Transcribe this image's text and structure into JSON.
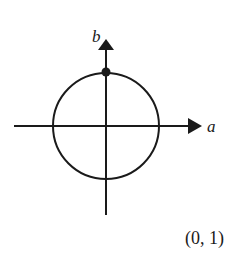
{
  "diagram": {
    "axes": {
      "horizontal_label": "a",
      "vertical_label": "b"
    },
    "circle": {
      "center": [
        0,
        0
      ],
      "radius": 1,
      "description": "unit circle"
    },
    "highlighted_point": {
      "coordinates": [
        0,
        1
      ]
    },
    "caption": "(0, 1)",
    "colors": {
      "stroke": "#1a1a1a",
      "background": "#ffffff"
    }
  }
}
